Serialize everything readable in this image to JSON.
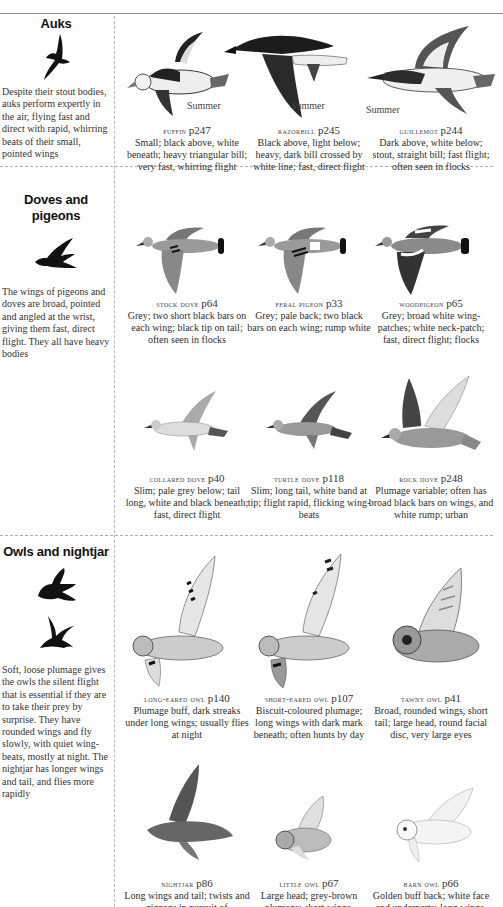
{
  "sections": [
    {
      "title": "Auks",
      "description": "Despite their stout bodies, auks perform expertly in the air, flying fast and direct with rapid, whirring beats of their small, pointed wings",
      "silhouettes": [
        "auk-silhouette-icon"
      ],
      "birds": [
        {
          "name": "PUFFIN",
          "page": "p247",
          "label": "Summer",
          "caption": "Small; black above, white beneath; heavy triangular bill; very fast, whirring flight"
        },
        {
          "name": "RAZORBILL",
          "page": "p245",
          "label": "Summer",
          "caption": "Black above, light below; heavy, dark bill crossed by white line; fast, direct flight"
        },
        {
          "name": "GUILLEMOT",
          "page": "p244",
          "label": "Summer",
          "caption": "Dark above, white below; stout, straight bill; fast flight; often seen in flocks"
        }
      ]
    },
    {
      "title": "Doves and pigeons",
      "description": "The wings of pigeons and doves are broad, pointed and angled at the wrist, giving them fast, direct flight. They all have heavy bodies",
      "silhouettes": [
        "pigeon-silhouette-icon"
      ],
      "birds": [
        {
          "name": "STOCK DOVE",
          "page": "p64",
          "caption": "Grey; two short black bars on each wing; black tip on tail; often seen in flocks"
        },
        {
          "name": "FERAL PIGEON",
          "page": "p33",
          "caption": "Grey; pale back; two black bars on each wing; rump white"
        },
        {
          "name": "WOODPIGEON",
          "page": "p65",
          "caption": "Grey; broad white wing-patches; white neck-patch; fast, direct flight; flocks"
        },
        {
          "name": "COLLARED DOVE",
          "page": "p40",
          "caption": "Slim; pale grey below; tail long, white and black beneath; fast, direct flight"
        },
        {
          "name": "TURTLE DOVE",
          "page": "p118",
          "caption": "Slim; long tail, white band at tip; flight rapid, flicking wing-beats"
        },
        {
          "name": "ROCK DOVE",
          "page": "p248",
          "caption": "Plumage variable; often has broad black bars on wings, and white rump; urban"
        }
      ]
    },
    {
      "title": "Owls and nightjar",
      "description": "Soft, loose plumage gives the owls the silent flight that is essential if they are to take their prey by surprise. They have rounded wings and fly slowly, with quiet wing-beats, mostly at night. The nightjar has longer wings and tail, and flies more rapidly",
      "silhouettes": [
        "owl-silhouette-icon",
        "nightjar-silhouette-icon"
      ],
      "birds": [
        {
          "name": "LONG-EARED OWL",
          "page": "p140",
          "caption": "Plumage buff, dark streaks under long wings; usually flies at night"
        },
        {
          "name": "SHORT-EARED OWL",
          "page": "p107",
          "caption": "Biscuit-coloured plumage; long wings with dark mark beneath; often hunts by day"
        },
        {
          "name": "TAWNY OWL",
          "page": "p41",
          "caption": "Broad, rounded wings, short tail; large head, round facial disc, very large eyes"
        },
        {
          "name": "NIGHTJAR",
          "page": "p86",
          "caption": "Long wings and tail; twists and zigzags in pursuit of"
        },
        {
          "name": "LITTLE OWL",
          "page": "p67",
          "caption": "Large head; grey-brown plumage; short wings,"
        },
        {
          "name": "BARN OWL",
          "page": "p66",
          "caption": "Golden buff back; white face and underparts; long wings,"
        }
      ]
    }
  ]
}
